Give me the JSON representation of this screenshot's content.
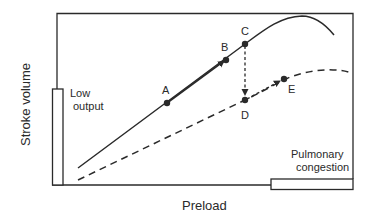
{
  "diagram": {
    "type": "Frank-Starling ventricular function curves",
    "axes": {
      "x_label": "Preload",
      "y_label": "Stroke volume"
    },
    "annotations": {
      "low_output_line1": "Low",
      "low_output_line2": "output",
      "pulmonary_line1": "Pulmonary",
      "pulmonary_line2": "congestion"
    },
    "curves": [
      {
        "name": "normal",
        "style": "solid"
      },
      {
        "name": "depressed",
        "style": "dashed"
      }
    ],
    "points": [
      {
        "id": "A",
        "label": "A",
        "curve": "normal"
      },
      {
        "id": "B",
        "label": "B",
        "curve": "normal"
      },
      {
        "id": "C",
        "label": "C",
        "curve": "normal"
      },
      {
        "id": "D",
        "label": "D",
        "curve": "depressed"
      },
      {
        "id": "E",
        "label": "E",
        "curve": "depressed"
      }
    ],
    "colors": {
      "line": "#2a2a2a",
      "background": "#ffffff"
    }
  }
}
